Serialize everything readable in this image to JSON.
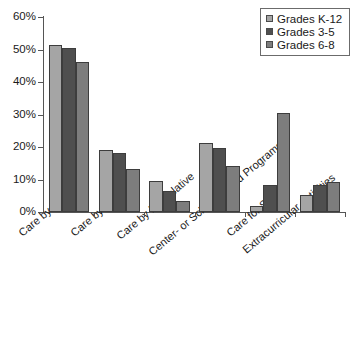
{
  "chart_data": {
    "type": "bar",
    "title": "",
    "xlabel": "",
    "ylabel": "",
    "ylim": [
      0,
      60
    ],
    "ytick_labels": [
      "60%",
      "50%",
      "40%",
      "30%",
      "20%",
      "10%",
      "0%"
    ],
    "ytick_values": [
      60,
      50,
      40,
      30,
      20,
      10,
      0
    ],
    "grid": false,
    "legend_position": "top-right",
    "categories": [
      "Care by Parents",
      "Care by Relative",
      "Care by Nonrelative",
      "Center- or School-based Programs",
      "Care for Self",
      "Extracurricular Activities"
    ],
    "series": [
      {
        "name": "Grades K-12",
        "color": "#a5a5a5",
        "values": [
          51.5,
          19.2,
          9.6,
          21.2,
          1.8,
          5.3
        ]
      },
      {
        "name": "Grades 3-5",
        "color": "#4f4f4f",
        "values": [
          50.5,
          18.3,
          6.5,
          19.8,
          8.3,
          8.2
        ]
      },
      {
        "name": "Grades 6-8",
        "color": "#7d7d7d",
        "values": [
          46.1,
          13.1,
          3.3,
          14.2,
          30.5,
          9.2
        ]
      }
    ]
  }
}
